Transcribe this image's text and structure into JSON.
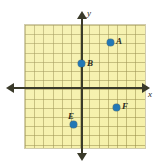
{
  "figure": {
    "type": "coordinate-plane",
    "background_color": "#ffffff",
    "grid_color": "#f5f0a8",
    "grid_line_color": "#968c46",
    "axis_color": "#3a3a2a",
    "point_color": "#2277b5",
    "label_color": "#2b2b20"
  },
  "axes": {
    "x_label": "x",
    "y_label": "y",
    "x_arrow_left": "arrow-left",
    "x_arrow_right": "arrow-right",
    "y_arrow_up": "arrow-up",
    "y_arrow_down": "arrow-down"
  },
  "chart_data": {
    "type": "scatter",
    "title": "",
    "xlabel": "x",
    "ylabel": "y",
    "grid": true,
    "legend": "none",
    "xlim": [
      -6,
      7
    ],
    "ylim": [
      -7,
      7
    ],
    "gridline_spacing": 1,
    "points": [
      {
        "label": "A",
        "x": 3,
        "y": 5,
        "label_position": "right"
      },
      {
        "label": "B",
        "x": 0,
        "y": 3,
        "label_position": "right"
      },
      {
        "label": "E",
        "x": -1,
        "y": -4,
        "label_position": "above-left"
      },
      {
        "label": "F",
        "x": 4,
        "y": -2,
        "label_position": "right"
      }
    ]
  },
  "points_pixels": [
    {
      "label": "A",
      "cx": 110,
      "cy": 42,
      "lx": 116,
      "ly": 37
    },
    {
      "label": "B",
      "cx": 81,
      "cy": 63,
      "lx": 87,
      "ly": 59
    },
    {
      "label": "E",
      "cx": 73,
      "cy": 124,
      "lx": 68,
      "ly": 112
    },
    {
      "label": "F",
      "cx": 116,
      "cy": 107,
      "lx": 122,
      "ly": 102
    }
  ],
  "labels": {
    "point_a": "A",
    "point_b": "B",
    "point_e": "E",
    "point_f": "F"
  }
}
